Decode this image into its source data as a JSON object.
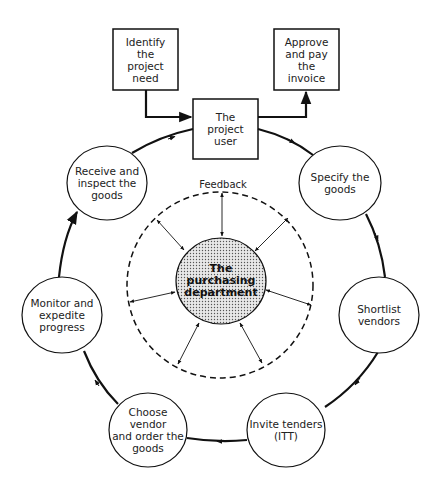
{
  "diagram": {
    "boxes": {
      "identify": {
        "label": "Identify\nthe\nproject\nneed"
      },
      "approve": {
        "label": "Approve\nand pay\nthe\ninvoice"
      },
      "user": {
        "label": "The\nproject\nuser"
      }
    },
    "cycle_nodes": [
      {
        "id": "specify",
        "label": "Specify the\ngoods"
      },
      {
        "id": "shortlist",
        "label": "Shortlist\nvendors"
      },
      {
        "id": "invite",
        "label": "Invite tenders\n(ITT)"
      },
      {
        "id": "choose",
        "label": "Choose vendor\nand order the\ngoods"
      },
      {
        "id": "monitor",
        "label": "Monitor and\nexpedite\nprogress"
      },
      {
        "id": "receive",
        "label": "Receive and\ninspect the\ngoods"
      }
    ],
    "center": {
      "label": "The\npurchasing\ndepartment"
    },
    "feedback_label": "Feedback",
    "colors": {
      "stroke": "#111111",
      "fill": "#ffffff",
      "center_fill": "#e6e6e6",
      "dot": "#555555"
    }
  }
}
